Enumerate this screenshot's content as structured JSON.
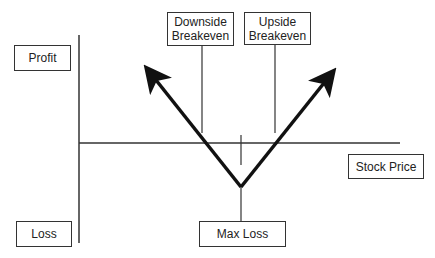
{
  "diagram": {
    "type": "long straddle payoff diagram",
    "labels": {
      "profit": "Profit",
      "loss": "Loss",
      "x_axis": "Stock Price",
      "downside_line1": "Downside",
      "downside_line2": "Breakeven",
      "upside_line1": "Upside",
      "upside_line2": "Breakeven",
      "max_loss": "Max Loss"
    },
    "colors": {
      "line": "#111111",
      "axis": "#333333",
      "background": "#ffffff"
    }
  }
}
